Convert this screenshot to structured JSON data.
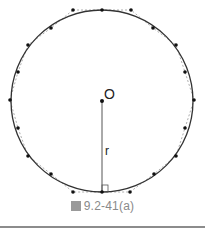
{
  "figure": {
    "caption_mark": "圖",
    "caption": "9.2-41(a)",
    "center_label": "O",
    "radius_label": "r",
    "colors": {
      "stroke": "#333333",
      "dots": "#111111",
      "dashed": "#999999",
      "caption": "#8a8a8a"
    },
    "circle": {
      "cx": 102,
      "cy": 101,
      "r": 91
    },
    "points": [
      [
        73,
        10
      ],
      [
        102,
        10
      ],
      [
        131,
        10
      ],
      [
        153,
        28
      ],
      [
        176,
        45
      ],
      [
        185,
        72
      ],
      [
        194,
        100
      ],
      [
        185,
        128
      ],
      [
        176,
        156
      ],
      [
        154,
        174
      ],
      [
        130,
        192
      ],
      [
        102,
        192
      ],
      [
        73,
        192
      ],
      [
        51,
        174
      ],
      [
        28,
        156
      ],
      [
        18,
        128
      ],
      [
        10,
        100
      ],
      [
        18,
        72
      ],
      [
        28,
        45
      ],
      [
        51,
        28
      ]
    ]
  }
}
